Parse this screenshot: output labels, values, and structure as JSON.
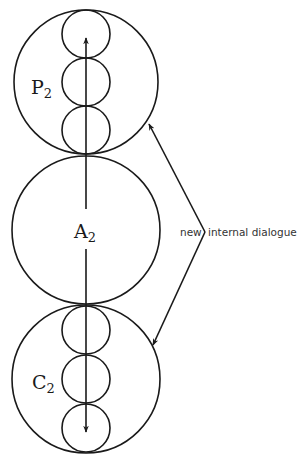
{
  "diagram": {
    "type": "ego-state circles",
    "circles": [
      {
        "id": "P",
        "label": "P",
        "subscript": "2",
        "cx": 86,
        "cy": 82,
        "r": 72,
        "inner_circles": [
          {
            "cy": 34,
            "r": 24
          },
          {
            "cy": 82,
            "r": 24
          },
          {
            "cy": 130,
            "r": 24
          }
        ],
        "arrow_direction": "up"
      },
      {
        "id": "A",
        "label": "A",
        "subscript": "2",
        "cx": 86,
        "cy": 230,
        "r": 74,
        "inner_circles": [],
        "arrow_direction": "none"
      },
      {
        "id": "C",
        "label": "C",
        "subscript": "2",
        "cx": 86,
        "cy": 379,
        "r": 74,
        "inner_circles": [
          {
            "cy": 330,
            "r": 24
          },
          {
            "cy": 379,
            "r": 24
          },
          {
            "cy": 428,
            "r": 24
          }
        ],
        "arrow_direction": "down"
      }
    ],
    "annotation": {
      "text_left": "new",
      "text_right": "internal dialogue",
      "vertex": {
        "x": 205,
        "y": 232
      },
      "arrow_targets": [
        {
          "x": 149,
          "y": 124
        },
        {
          "x": 153,
          "y": 345
        }
      ]
    },
    "colors": {
      "stroke": "#1a1a1a",
      "background": "#ffffff"
    }
  }
}
